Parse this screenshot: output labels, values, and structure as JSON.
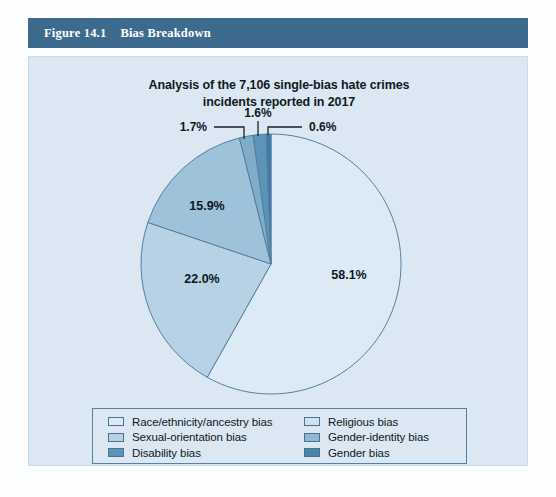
{
  "figure": {
    "number": "Figure 14.1",
    "title": "Bias Breakdown",
    "header_color": "#3d6b8e",
    "panel_color": "#dbe8f3"
  },
  "chart_data": {
    "type": "pie",
    "title": "Analysis of the 7,106 single-bias hate crimes incidents reported in 2017",
    "title_line1": "Analysis of the 7,106 single-bias hate crimes",
    "title_line2": "incidents reported in 2017",
    "total_incidents": "7,106",
    "year": "2017",
    "start_angle_deg": 0,
    "direction": "clockwise",
    "categories": [
      "Race/ethnicity/ancestry bias",
      "Religious bias",
      "Sexual-orientation bias",
      "Gender-identity bias",
      "Disability bias",
      "Gender bias"
    ],
    "values": [
      58.1,
      22.0,
      15.9,
      1.7,
      1.6,
      0.6
    ],
    "value_labels": [
      "58.1%",
      "22.0%",
      "15.9%",
      "1.7%",
      "1.6%",
      "0.6%"
    ],
    "colors": [
      "#dceaf5",
      "#b7d2e5",
      "#9ec2da",
      "#7fadc9",
      "#5d93b6",
      "#3f7ba4"
    ],
    "labels_inside": [
      "58.1%",
      "22.0%",
      "15.9%"
    ],
    "labels_callout": [
      "1.7%",
      "1.6%",
      "0.6%"
    ],
    "legend_position": "bottom",
    "slice_order_note": "drawn clockwise from 12 o'clock: 58.1, 22.0, 15.9, 1.7, 1.6, 0.6"
  },
  "labels": {
    "pct_race": "58.1%",
    "pct_religious": "22.0%",
    "pct_sexual": "15.9%",
    "pct_gender_identity": "1.7%",
    "pct_disability": "1.6%",
    "pct_gender": "0.6%"
  },
  "legend": {
    "items": [
      {
        "label": "Race/ethnicity/ancestry bias",
        "color": "#dceaf5"
      },
      {
        "label": "Religious bias",
        "color": "#cfe2f0"
      },
      {
        "label": "Sexual-orientation bias",
        "color": "#b7d2e5"
      },
      {
        "label": "Gender-identity bias",
        "color": "#8fb8d3"
      },
      {
        "label": "Disability bias",
        "color": "#5d93b6"
      },
      {
        "label": "Gender bias",
        "color": "#4a85ad"
      }
    ]
  }
}
